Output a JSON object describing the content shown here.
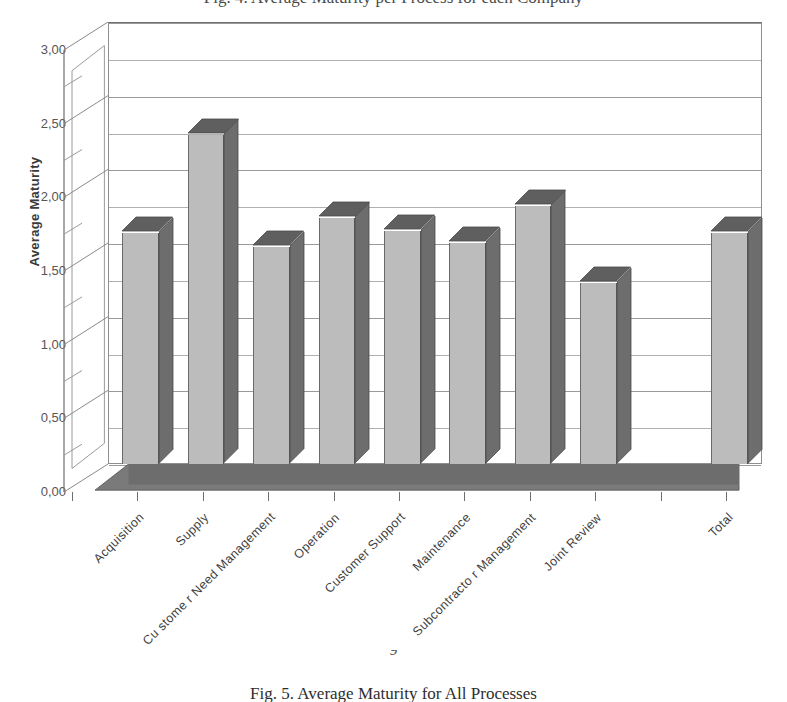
{
  "figure": {
    "top_cropped_caption": "Fig. 4. Average Maturity per Process for each Company",
    "caption": "Fig. 5.  Average Maturity for All Processes",
    "page_number": "9"
  },
  "chart_data": {
    "type": "bar",
    "title": "",
    "xlabel": "",
    "ylabel": "Average Maturity",
    "ylim": [
      0,
      3
    ],
    "ytick_labels": [
      "0,00",
      "0,50",
      "1,00",
      "1,50",
      "2,00",
      "2,50",
      "3,00"
    ],
    "ytick_values": [
      0,
      0.5,
      1.0,
      1.5,
      2.0,
      2.5,
      3.0
    ],
    "minor_tick_step": 0.25,
    "grid": true,
    "legend": "none",
    "style": "3d-column",
    "categories": [
      "Acquisition",
      "Supply",
      "Cu stome r Need Management",
      "Operation",
      "Customer Support",
      "Maintenance",
      "Subcontracto r Management",
      "Joint Review",
      "Total"
    ],
    "values": [
      1.57,
      2.23,
      1.47,
      1.67,
      1.58,
      1.5,
      1.75,
      1.23,
      1.57
    ],
    "gap_before_last_category": true,
    "colors": {
      "bar_front": "#bcbcbc",
      "bar_side": "#6d6d6d",
      "bar_top": "#5f5f5f",
      "gridline": "#9a9a9a",
      "axis": "#6f6f6f",
      "floor": "#6d6d6d",
      "background": "#ffffff",
      "text": "#3f3f3f"
    }
  }
}
